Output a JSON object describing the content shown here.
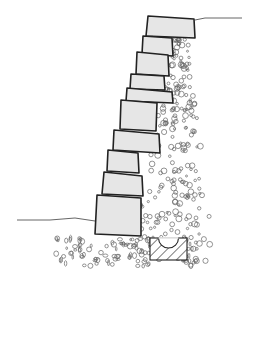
{
  "diagram": {
    "colors": {
      "background": "#ffffff",
      "block_fill": "#e6e6e6",
      "outline": "#222222",
      "gravel": "#666666",
      "ground_line": "#555555"
    },
    "blocks": [
      {
        "points": "148,16 194,19 195,38 146,36"
      },
      {
        "points": "143,36 172,38 173,56 142,54"
      },
      {
        "points": "137,52 168,55 169,76 136,74"
      },
      {
        "points": "131,74 164,76 165,90 130,89"
      },
      {
        "points": "127,88 172,92 173,103 126,101"
      },
      {
        "points": "121,100 157,103 156,131 120,129"
      },
      {
        "points": "114,130 159,134 160,153 113,150"
      },
      {
        "points": "108,150 138,153 139,173 107,171"
      },
      {
        "points": "104,172 142,176 143,196 102,194"
      },
      {
        "points": "97,195 141,198 141,236 95,234"
      }
    ],
    "ground_lines": [
      {
        "d": "M195,20 L205,18 L242,18"
      },
      {
        "d": "M17,220 L50,220 L75,218 L95,221"
      }
    ],
    "drain": {
      "label": "drain pipe",
      "x": 150,
      "y": 238,
      "w": 37,
      "h": 22,
      "pipe_r": 10
    }
  }
}
